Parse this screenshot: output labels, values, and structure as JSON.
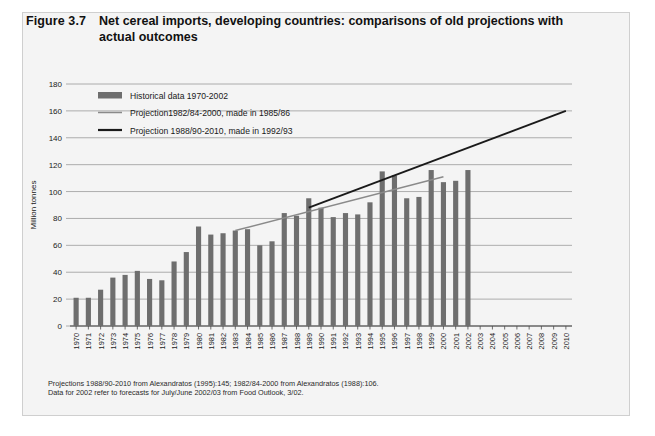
{
  "figure": {
    "number": "Figure 3.7",
    "title": "Net cereal imports, developing countries: comparisons of old projections with actual outcomes"
  },
  "footnotes": [
    "Projections 1988/90-2010 from Alexandratos (1995):145; 1982/84-2000 from Alexandratos (1988):106.",
    "Data for 2002 refer to forecasts for July/June 2002/03 from Food Outlook, 3/02."
  ],
  "colors": {
    "bar": "#6e6e6e",
    "projection_1985_86": "#8a8a8a",
    "projection_1992_93": "#1a1a1a",
    "grid": "#9a9a9a",
    "panel_background": "#f4f4f4",
    "panel_border": "#cfcfcf"
  },
  "chart_data": {
    "type": "bar",
    "title": "Net cereal imports, developing countries: comparisons of old projections with actual outcomes",
    "xlabel": "",
    "ylabel": "Million tonnes",
    "ylim": [
      0,
      180
    ],
    "yticks": [
      0,
      20,
      40,
      60,
      80,
      100,
      120,
      140,
      160,
      180
    ],
    "grid": true,
    "legend_position": "top-left-inside",
    "categories": [
      "1970",
      "1971",
      "1972",
      "1973",
      "1974",
      "1975",
      "1976",
      "1977",
      "1978",
      "1979",
      "1980",
      "1981",
      "1982",
      "1983",
      "1984",
      "1985",
      "1986",
      "1987",
      "1988",
      "1989",
      "1990",
      "1991",
      "1992",
      "1993",
      "1994",
      "1995",
      "1996",
      "1997",
      "1998",
      "1999",
      "2000",
      "2001",
      "2002",
      "2003",
      "2004",
      "2005",
      "2006",
      "2007",
      "2008",
      "2009",
      "2010"
    ],
    "series": [
      {
        "name": "Historical data 1970-2002",
        "type": "bar",
        "color": "#6e6e6e",
        "values": [
          21,
          21,
          27,
          36,
          38,
          41,
          35,
          34,
          48,
          55,
          74,
          68,
          69,
          71,
          72,
          60,
          63,
          84,
          82,
          95,
          88,
          81,
          84,
          83,
          92,
          115,
          112,
          95,
          96,
          116,
          107,
          108,
          116,
          null,
          null,
          null,
          null,
          null,
          null,
          null,
          null
        ]
      },
      {
        "name": "Projection1982/84-2000, made in 1985/86",
        "type": "line",
        "color": "#8a8a8a",
        "points": [
          {
            "x": "1983",
            "y": 71
          },
          {
            "x": "2000",
            "y": 111
          }
        ]
      },
      {
        "name": "Projection 1988/90-2010, made in 1992/93",
        "type": "line",
        "color": "#1a1a1a",
        "points": [
          {
            "x": "1989",
            "y": 88
          },
          {
            "x": "2010",
            "y": 160
          }
        ]
      }
    ],
    "legend": [
      {
        "label": "Historical data 1970-2002",
        "marker": "bar",
        "color": "#6e6e6e"
      },
      {
        "label": "Projection1982/84-2000, made in 1985/86",
        "marker": "line",
        "color": "#8a8a8a"
      },
      {
        "label": "Projection 1988/90-2010, made in 1992/93",
        "marker": "line",
        "color": "#1a1a1a"
      }
    ]
  }
}
